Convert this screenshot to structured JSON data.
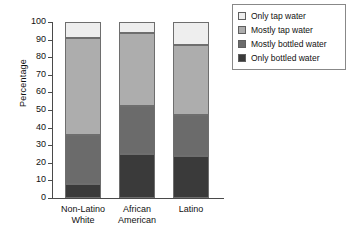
{
  "chart_data": {
    "type": "bar",
    "subtype": "stacked-100",
    "title": "",
    "xlabel": "",
    "ylabel": "Percentage",
    "ylim": [
      0,
      100
    ],
    "yticks": [
      0,
      10,
      20,
      30,
      40,
      50,
      60,
      70,
      80,
      90,
      100
    ],
    "ytick_labels": [
      "0",
      "10",
      "20",
      "30",
      "40",
      "50",
      "60",
      "70",
      "80",
      "90",
      "100"
    ],
    "grid": false,
    "legend_position": "top-right",
    "categories": [
      "Non-Latino White",
      "African American",
      "Latino"
    ],
    "category_lines": [
      [
        "Non-Latino",
        "White"
      ],
      [
        "African",
        "American"
      ],
      [
        "Latino",
        ""
      ]
    ],
    "series": [
      {
        "name": "Only bottled water",
        "color": "#3a3a3a",
        "values": [
          8,
          25,
          24
        ]
      },
      {
        "name": "Mostly bottled water",
        "color": "#6b6b6b",
        "values": [
          28,
          27,
          23
        ]
      },
      {
        "name": "Mostly tap water",
        "color": "#adadad",
        "values": [
          55,
          42,
          40
        ]
      },
      {
        "name": "Only tap water",
        "color": "#eeeeee",
        "values": [
          9,
          6,
          13
        ]
      }
    ],
    "stack_order_bottom_to_top": [
      "Only bottled water",
      "Mostly bottled water",
      "Mostly tap water",
      "Only tap water"
    ],
    "cumulative_tops": {
      "Non-Latino White": [
        8,
        36,
        91,
        100
      ],
      "African American": [
        25,
        52,
        94,
        100
      ],
      "Latino": [
        24,
        47,
        87,
        100
      ]
    }
  },
  "legend": {
    "items": [
      {
        "label": "Only tap water",
        "color": "#eeeeee"
      },
      {
        "label": "Mostly tap water",
        "color": "#adadad"
      },
      {
        "label": "Mostly bottled water",
        "color": "#6b6b6b"
      },
      {
        "label": "Only bottled water",
        "color": "#3a3a3a"
      }
    ]
  }
}
